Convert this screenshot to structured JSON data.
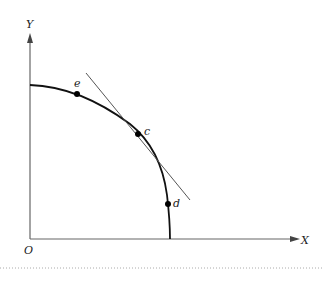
{
  "diagram": {
    "type": "production-possibility-frontier",
    "axes": {
      "x_label": "X",
      "y_label": "Y",
      "origin_label": "O"
    },
    "points": [
      {
        "label": "e",
        "x": 77,
        "y": 94
      },
      {
        "label": "c",
        "x": 138,
        "y": 134
      },
      {
        "label": "d",
        "x": 168,
        "y": 204
      }
    ],
    "tangent": {
      "at": "c",
      "from": [
        86,
        73
      ],
      "to": [
        190,
        200
      ]
    },
    "colors": {
      "curve": "#111111",
      "axis": "#555555",
      "tangent": "#444444"
    }
  }
}
